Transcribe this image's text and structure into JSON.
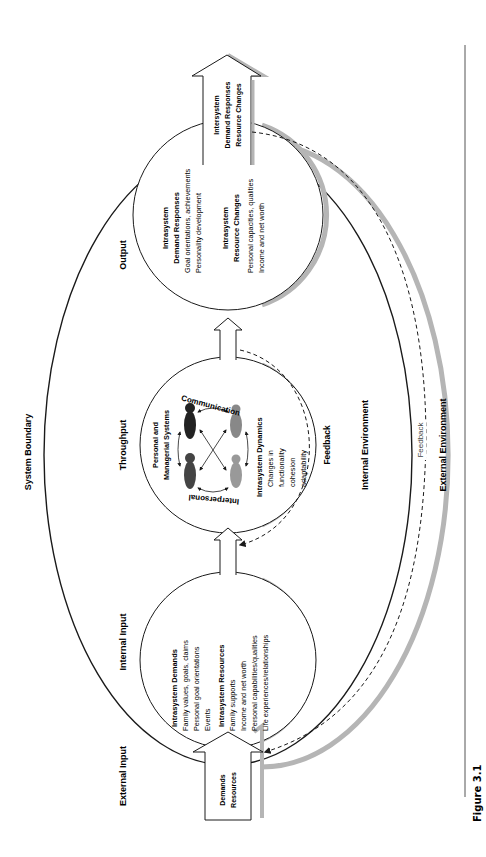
{
  "figure": {
    "caption": "Figure 3.1"
  },
  "labels": {
    "system_boundary": "System Boundary",
    "external_input": "External Input",
    "internal_input": "Internal Input",
    "throughput": "Throughput",
    "output": "Output",
    "internal_environment": "Internal Environment",
    "external_environment": "External Environment",
    "feedback_inner": "Feedback",
    "feedback_outer": "Feedback"
  },
  "input_arrow": {
    "lines": [
      "Demands",
      "Resources"
    ]
  },
  "output_arrow": {
    "lines": [
      "Intersystem",
      "Demand Responses",
      "Resource Changes"
    ]
  },
  "input_circle": {
    "demands_title": "Intrasystem Demands",
    "demands_items": [
      "Family values, goals, claims",
      "Personal goal orientations",
      "Events"
    ],
    "resources_title": "Intrasystem Resources",
    "resources_items": [
      "Family supports",
      "Income and net worth",
      "Personal capabilities/qualities",
      "Life experiences/relationships"
    ]
  },
  "throughput_circle": {
    "title_lines": [
      "Personal and",
      "Managerial Systems"
    ],
    "arc_top": "Communication",
    "arc_bottom": "Interpersonal",
    "dynamics_title": "Intrasystem Dynamics",
    "dynamics_items": [
      "Changes in",
      "functionality",
      "cohesion",
      "adaptability"
    ]
  },
  "output_circle": {
    "responses_title_lines": [
      "Intrasystem",
      "Demand Responses"
    ],
    "responses_items": [
      "Goal orientations, achievements",
      "Personality development"
    ],
    "changes_title_lines": [
      "Intrasystem",
      "Resource Changes"
    ],
    "changes_items": [
      "Personal capacities, qualities",
      "Income and net worth"
    ]
  },
  "colors": {
    "line": "#1a1a1a",
    "shadow": "#b5b5b5",
    "feedback_text": "#444444"
  }
}
